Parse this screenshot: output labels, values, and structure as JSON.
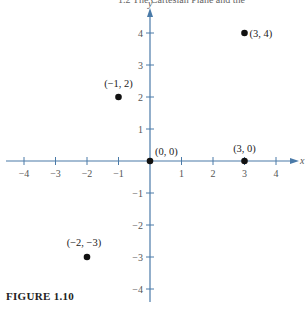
{
  "header": {
    "running_title": "1.2   The Cartesian Plane and the"
  },
  "caption": "FIGURE 1.10",
  "colors": {
    "axis": "#4a7aa8",
    "point": "#111111"
  },
  "chart_data": {
    "type": "scatter",
    "title": "",
    "xlabel": "x",
    "ylabel": "y",
    "xlim": [
      -4.5,
      4.5
    ],
    "ylim": [
      -4.3,
      4.7
    ],
    "grid": false,
    "x_ticks": [
      -4,
      -3,
      -2,
      -1,
      1,
      2,
      3,
      4
    ],
    "y_ticks": [
      -4,
      -3,
      -2,
      -1,
      1,
      2,
      3,
      4
    ],
    "points": [
      {
        "x": 3,
        "y": 4,
        "label": "(3, 4)"
      },
      {
        "x": -1,
        "y": 2,
        "label": "(−1, 2)"
      },
      {
        "x": 0,
        "y": 0,
        "label": "(0, 0)"
      },
      {
        "x": 3,
        "y": 0,
        "label": "(3, 0)"
      },
      {
        "x": -2,
        "y": -3,
        "label": "(−2, −3)"
      }
    ]
  }
}
